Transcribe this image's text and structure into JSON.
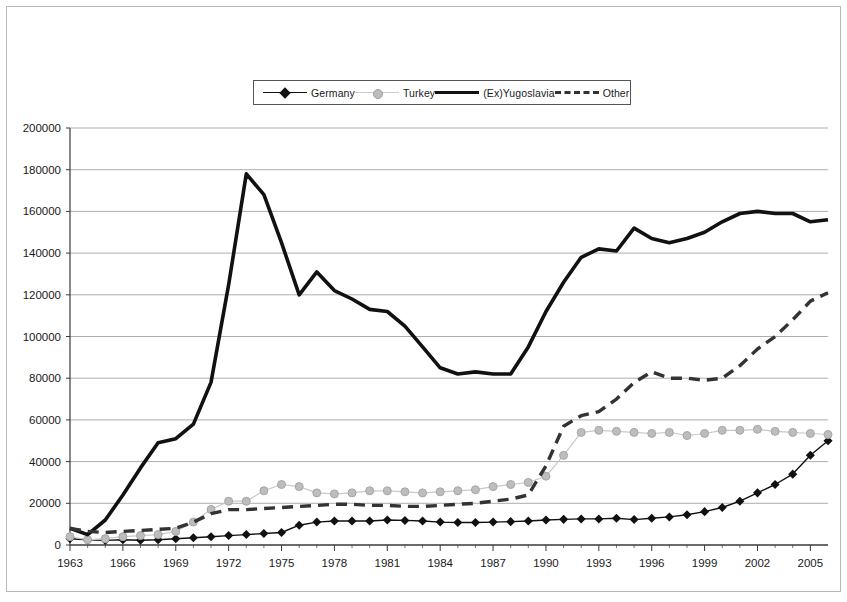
{
  "legend": {
    "position": "top-center",
    "entries": [
      {
        "name": "Germany",
        "marker": "diamond",
        "line": "solid-thin",
        "color": "#111111"
      },
      {
        "name": "Turkey",
        "marker": "circle",
        "line": "solid-light",
        "color": "#bdbdbd"
      },
      {
        "name": "(Ex)Yugoslavia",
        "marker": "none",
        "line": "solid-thick",
        "color": "#111111"
      },
      {
        "name": "Other",
        "marker": "none",
        "line": "dashed",
        "color": "#333333"
      }
    ]
  },
  "chart_data": {
    "type": "line",
    "title": "",
    "subtitle": "",
    "xlabel": "",
    "ylabel": "",
    "grid": true,
    "legend_position": "top-center",
    "xlim": [
      1963,
      2006
    ],
    "ylim": [
      0,
      200000
    ],
    "ytick_step": 20000,
    "ytick_labels": [
      "0",
      "20000",
      "40000",
      "60000",
      "80000",
      "100000",
      "120000",
      "140000",
      "160000",
      "180000",
      "200000"
    ],
    "yticks": [
      0,
      20000,
      40000,
      60000,
      80000,
      100000,
      120000,
      140000,
      160000,
      180000,
      200000
    ],
    "xtick_labels": [
      "1963",
      "1966",
      "1969",
      "1972",
      "1975",
      "1978",
      "1981",
      "1984",
      "1987",
      "1990",
      "1993",
      "1996",
      "1999",
      "2002",
      "2005"
    ],
    "xticks": [
      1963,
      1966,
      1969,
      1972,
      1975,
      1978,
      1981,
      1984,
      1987,
      1990,
      1993,
      1996,
      1999,
      2002,
      2005
    ],
    "x": [
      1963,
      1964,
      1965,
      1966,
      1967,
      1968,
      1969,
      1970,
      1971,
      1972,
      1973,
      1974,
      1975,
      1976,
      1977,
      1978,
      1979,
      1980,
      1981,
      1982,
      1983,
      1984,
      1985,
      1986,
      1987,
      1988,
      1989,
      1990,
      1991,
      1992,
      1993,
      1994,
      1995,
      1996,
      1997,
      1998,
      1999,
      2000,
      2001,
      2002,
      2003,
      2004,
      2005,
      2006
    ],
    "series": [
      {
        "name": "Germany",
        "marker": "diamond",
        "line": "solid-thin",
        "color": "#111111",
        "values": [
          3000,
          2500,
          2200,
          2500,
          2300,
          2500,
          3000,
          3500,
          4000,
          4500,
          5000,
          5500,
          6000,
          9500,
          11000,
          11500,
          11500,
          11500,
          12000,
          11800,
          11500,
          11000,
          10800,
          10800,
          11000,
          11200,
          11500,
          12000,
          12300,
          12500,
          12500,
          12800,
          12200,
          12800,
          13500,
          14500,
          16000,
          18000,
          21000,
          25000,
          29000,
          34000,
          43000,
          50000
        ]
      },
      {
        "name": "Turkey",
        "marker": "circle",
        "line": "solid-light",
        "color": "#bdbdbd",
        "values": [
          4000,
          2500,
          3000,
          4000,
          4500,
          5000,
          6500,
          11000,
          17000,
          21000,
          21000,
          26000,
          29000,
          28000,
          25000,
          24500,
          25000,
          26000,
          26000,
          25500,
          25000,
          25500,
          26000,
          26500,
          28000,
          29000,
          30000,
          33000,
          43000,
          54000,
          55000,
          54500,
          54000,
          53500,
          54000,
          52500,
          53500,
          55000,
          55000,
          55500,
          54500,
          54000,
          53500,
          53000
        ]
      },
      {
        "name": "(Ex)Yugoslavia",
        "marker": "none",
        "line": "solid-thick",
        "color": "#111111",
        "values": [
          8000,
          5000,
          12000,
          24000,
          37000,
          49000,
          51000,
          58000,
          78000,
          125000,
          178000,
          168000,
          145000,
          120000,
          131000,
          122000,
          118000,
          113000,
          112000,
          105000,
          95000,
          85000,
          82000,
          83000,
          82000,
          82000,
          95000,
          112000,
          126000,
          138000,
          142000,
          141000,
          152000,
          147000,
          145000,
          147000,
          150000,
          155000,
          159000,
          160000,
          159000,
          159000,
          155000,
          156000
        ]
      },
      {
        "name": "Other",
        "marker": "none",
        "line": "dashed",
        "color": "#333333",
        "values": [
          8000,
          6500,
          6000,
          6500,
          7000,
          7500,
          8000,
          11000,
          15000,
          17000,
          17000,
          17500,
          18000,
          18500,
          19000,
          19500,
          19500,
          19000,
          19000,
          18500,
          18500,
          19000,
          19500,
          20000,
          21000,
          22000,
          24000,
          38000,
          57000,
          62000,
          64000,
          70000,
          78000,
          83000,
          80000,
          80000,
          79000,
          80000,
          86000,
          94000,
          100000,
          108000,
          117000,
          121000
        ]
      }
    ]
  }
}
